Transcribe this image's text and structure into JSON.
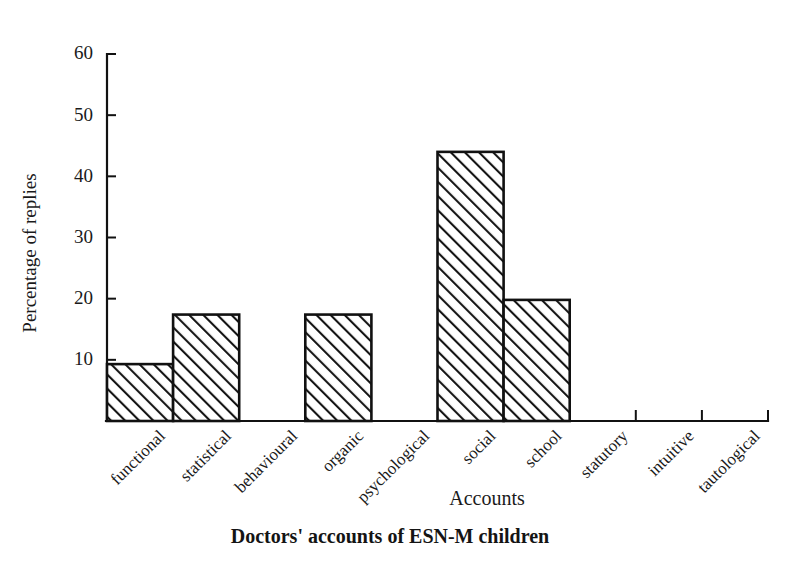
{
  "chart_data": {
    "type": "bar",
    "title": "",
    "subtitle": "",
    "caption": "Doctors' accounts of ESN-M children",
    "xlabel": "Accounts",
    "ylabel": "Percentage of replies",
    "categories": [
      "functional",
      "statistical",
      "behavioural",
      "organic",
      "psychological",
      "social",
      "school",
      "statutory",
      "intuitive",
      "tautological"
    ],
    "values": [
      9.3,
      17.4,
      0,
      17.4,
      0,
      44.0,
      19.8,
      0,
      0,
      0
    ],
    "ylim": [
      0,
      60
    ],
    "yticks": [
      10,
      20,
      30,
      40,
      50,
      60
    ],
    "ytick_labels": [
      "10",
      "20",
      "30",
      "40",
      "50",
      "60"
    ],
    "grid": false,
    "legend": "none",
    "bar_style": "diagonal-hatch",
    "bar_fill_color": "#ffffff",
    "bar_edge_color": "#111111",
    "axis_color": "#111111"
  },
  "figure": {
    "background_color": "#ffffff"
  }
}
